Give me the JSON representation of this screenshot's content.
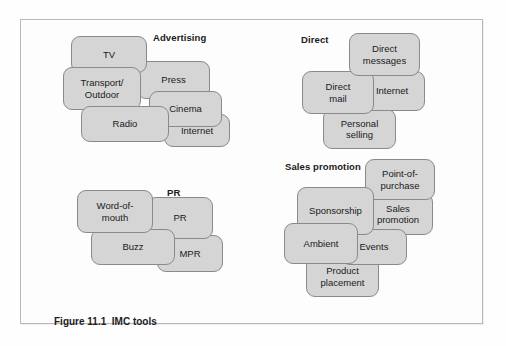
{
  "figure": {
    "caption": "Figure 11.1  IMC tools"
  },
  "clusters": [
    {
      "id": "advertising",
      "title": "Advertising",
      "title_pos": {
        "left": 152,
        "top": 31
      },
      "nodes": [
        {
          "name": "node-tv",
          "label": "TV",
          "left": 70,
          "top": 35,
          "width": 76,
          "height": 37,
          "z": 4
        },
        {
          "name": "node-press",
          "label": "Press",
          "left": 136,
          "top": 60,
          "width": 73,
          "height": 38,
          "z": 2
        },
        {
          "name": "node-transport-outdoor",
          "label": "Transport/\nOutdoor",
          "left": 62,
          "top": 66,
          "width": 78,
          "height": 43,
          "z": 5
        },
        {
          "name": "node-cinema",
          "label": "Cinema",
          "left": 148,
          "top": 90,
          "width": 73,
          "height": 36,
          "z": 3
        },
        {
          "name": "node-radio",
          "label": "Radio",
          "left": 80,
          "top": 105,
          "width": 88,
          "height": 36,
          "z": 6
        },
        {
          "name": "node-internet",
          "label": "Internet",
          "left": 163,
          "top": 113,
          "width": 66,
          "height": 33,
          "z": 1
        }
      ]
    },
    {
      "id": "direct",
      "title": "Direct",
      "title_pos": {
        "left": 300,
        "top": 33
      },
      "nodes": [
        {
          "name": "node-direct-messages",
          "label": "Direct\nmessages",
          "left": 348,
          "top": 32,
          "width": 71,
          "height": 43,
          "z": 4
        },
        {
          "name": "node-internet-direct",
          "label": "Internet",
          "left": 358,
          "top": 70,
          "width": 66,
          "height": 40,
          "z": 2
        },
        {
          "name": "node-direct-mail",
          "label": "Direct\nmail",
          "left": 301,
          "top": 70,
          "width": 72,
          "height": 43,
          "z": 3
        },
        {
          "name": "node-personal-selling",
          "label": "Personal\nselling",
          "left": 322,
          "top": 108,
          "width": 73,
          "height": 40,
          "z": 1
        }
      ]
    },
    {
      "id": "pr",
      "title": "PR",
      "title_pos": {
        "left": 166,
        "top": 186
      },
      "nodes": [
        {
          "name": "node-word-of-mouth",
          "label": "Word-of-\nmouth",
          "left": 76,
          "top": 189,
          "width": 76,
          "height": 43,
          "z": 4
        },
        {
          "name": "node-pr",
          "label": "PR",
          "left": 146,
          "top": 196,
          "width": 66,
          "height": 42,
          "z": 2
        },
        {
          "name": "node-buzz",
          "label": "Buzz",
          "left": 90,
          "top": 228,
          "width": 84,
          "height": 36,
          "z": 3
        },
        {
          "name": "node-mpr",
          "label": "MPR",
          "left": 156,
          "top": 234,
          "width": 66,
          "height": 37,
          "z": 1
        }
      ]
    },
    {
      "id": "sales-promotion",
      "title": "Sales promotion",
      "title_pos": {
        "left": 284,
        "top": 160
      },
      "nodes": [
        {
          "name": "node-point-of-purchase",
          "label": "Point-of-\npurchase",
          "left": 364,
          "top": 158,
          "width": 70,
          "height": 41,
          "z": 4
        },
        {
          "name": "node-sales-promotion",
          "label": "Sales\npromotion",
          "left": 362,
          "top": 192,
          "width": 70,
          "height": 42,
          "z": 2
        },
        {
          "name": "node-sponsorship",
          "label": "Sponsorship",
          "left": 296,
          "top": 186,
          "width": 77,
          "height": 48,
          "z": 5
        },
        {
          "name": "node-events",
          "label": "Events",
          "left": 340,
          "top": 228,
          "width": 66,
          "height": 36,
          "z": 3
        },
        {
          "name": "node-ambient",
          "label": "Ambient",
          "left": 283,
          "top": 222,
          "width": 74,
          "height": 41,
          "z": 6
        },
        {
          "name": "node-product-placement",
          "label": "Product\nplacement",
          "left": 305,
          "top": 255,
          "width": 73,
          "height": 41,
          "z": 1
        }
      ]
    }
  ],
  "colors": {
    "node_fill": "#d5d5d5",
    "node_stroke": "#8a8a8a",
    "frame_stroke": "#b9b9b9",
    "text": "#1a1a1a",
    "background": "#fdfdfd"
  }
}
